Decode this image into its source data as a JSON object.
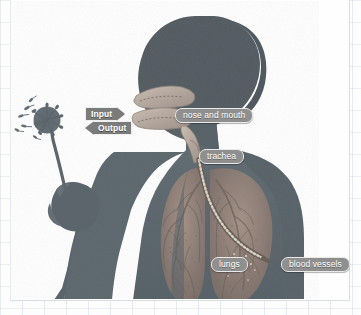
{
  "diagram": {
    "labels": {
      "nose_and_mouth": "nose and mouth",
      "trachea": "trachea",
      "lungs": "lungs",
      "blood_vessels": "blood vessels"
    },
    "flow": {
      "input": "Input",
      "output": "Output"
    },
    "colors": {
      "silhouette": "#5f6a70",
      "head_dark": "#565f65",
      "lung_tissue": "#8f7f78",
      "airway": "#b9ada3",
      "label_pill": "#8f8f8f",
      "flag": "#7b7b7b",
      "label_text": "#ffffff",
      "background": "#fefefe",
      "grid_line": "#c3ccd5"
    },
    "elements": {
      "dandelion": "dandelion-seed-head",
      "seeds": "blowing-seeds",
      "hand": "hand-holding-stem",
      "head": "human-head-profile",
      "torso": "human-torso",
      "bronchial_tree": "bronchial-and-vascular-tree"
    }
  }
}
